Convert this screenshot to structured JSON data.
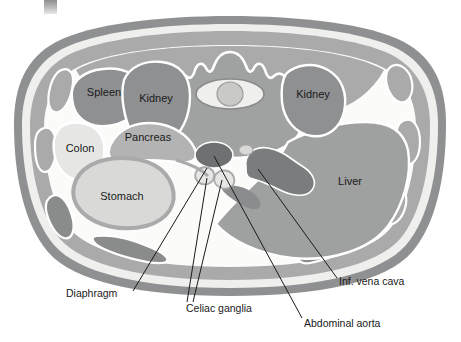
{
  "figure": {
    "kind": "anatomical-cross-section",
    "view": "abdominal transverse section",
    "background": "#ffffff"
  },
  "palette": {
    "skin_outer": "#8f9091",
    "fat_light": "#f2f2f0",
    "muscle_mid": "#a9aaa9",
    "muscle_dark": "#8a8b8b",
    "cavity_white": "#fbfbfa",
    "organ_dark": "#8f9092",
    "organ_mid": "#b2b3b2",
    "organ_light": "#d9dad8",
    "organ_pale": "#e6e7e5",
    "vessel_dark": "#6f7072",
    "vessel_mid": "#8b8c8e",
    "bone_mid": "#a0a1a1",
    "outline_white": "#ffffff",
    "text": "#1a1a1a",
    "leader": "#1a1a1a"
  },
  "organ_labels": [
    {
      "name": "spleen",
      "text": "Spleen",
      "x": 95,
      "y": 92
    },
    {
      "name": "kidney-left",
      "text": "Kidney",
      "x": 147,
      "y": 98
    },
    {
      "name": "colon",
      "text": "Colon",
      "x": 80,
      "y": 144
    },
    {
      "name": "pancreas",
      "text": "Pancreas",
      "x": 145,
      "y": 136
    },
    {
      "name": "stomach",
      "text": "Stomach",
      "x": 120,
      "y": 199
    },
    {
      "name": "kidney-right",
      "text": "Kidney",
      "x": 313,
      "y": 93
    },
    {
      "name": "liver",
      "text": "Liver",
      "x": 349,
      "y": 181
    }
  ],
  "callouts": [
    {
      "name": "diaphragm",
      "text": "Diaphragm",
      "text_x": 68,
      "text_y": 297,
      "anchor_x": 133,
      "anchor_y": 288,
      "target_x": 207,
      "target_y": 168
    },
    {
      "name": "celiac-ganglia",
      "text": "Celiac ganglia",
      "text_x": 186,
      "text_y": 312,
      "anchor_x": 184,
      "anchor_y": 303,
      "target_x": 207,
      "target_y": 178,
      "target2_x": 221,
      "target2_y": 180
    },
    {
      "name": "abdominal-aorta",
      "text": "Abdominal aorta",
      "text_x": 305,
      "text_y": 326,
      "anchor_x": 303,
      "anchor_y": 317,
      "target_x": 214,
      "target_y": 155
    },
    {
      "name": "inf-vena-cava",
      "text": "Inf. vena cava",
      "text_x": 340,
      "text_y": 285,
      "anchor_x": 338,
      "anchor_y": 277,
      "target_x": 258,
      "target_y": 169
    }
  ],
  "marks": {
    "corner_artifact": "gray-square"
  }
}
